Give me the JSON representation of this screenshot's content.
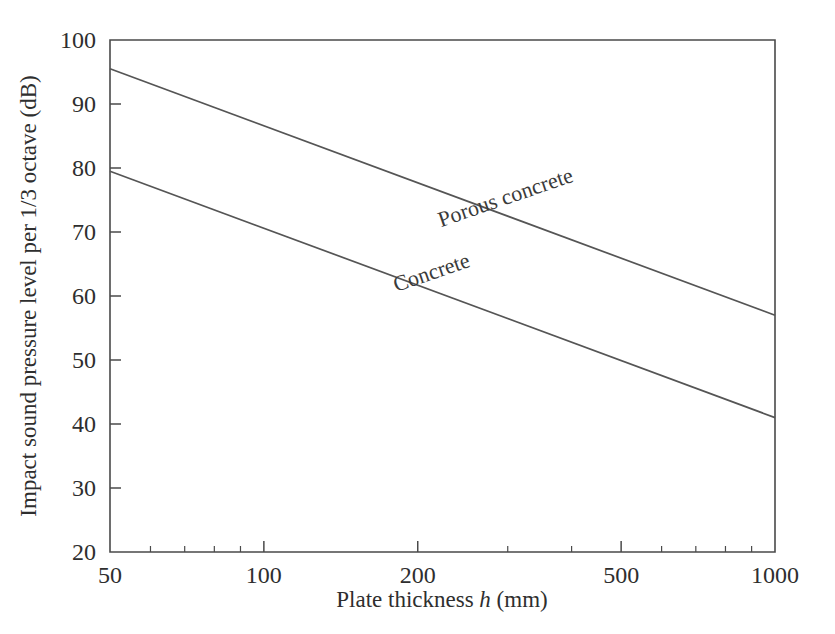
{
  "chart_data": {
    "type": "line",
    "title": "",
    "xlabel": "Plate thickness h (mm)",
    "xlabel_parts": {
      "prefix": "Plate thickness ",
      "italic": "h",
      "suffix": " (mm)"
    },
    "ylabel": "Impact sound pressure level per 1/3 octave (dB)",
    "xscale": "log",
    "yscale": "linear",
    "xlim": [
      50,
      1000
    ],
    "ylim": [
      20,
      100
    ],
    "xticks": [
      50,
      100,
      200,
      500,
      1000
    ],
    "xtick_labels": [
      "50",
      "100",
      "200",
      "500",
      "1000"
    ],
    "xticks_minor": [
      60,
      70,
      80,
      90,
      300,
      400,
      600,
      700,
      800,
      900
    ],
    "yticks": [
      20,
      30,
      40,
      50,
      60,
      70,
      80,
      90,
      100
    ],
    "ytick_labels": [
      "20",
      "30",
      "40",
      "50",
      "60",
      "70",
      "80",
      "90",
      "100"
    ],
    "grid": false,
    "legend": "inline-labels",
    "series": [
      {
        "name": "Porous concrete",
        "label": "Porous concrete",
        "label_rotation_deg": -19,
        "x": [
          50,
          1000
        ],
        "y": [
          95.5,
          57.0
        ],
        "points": [
          {
            "x": 50,
            "y": 95.5
          },
          {
            "x": 100,
            "y": 84.9
          },
          {
            "x": 200,
            "y": 74.3
          },
          {
            "x": 500,
            "y": 60.4
          },
          {
            "x": 1000,
            "y": 57.0
          }
        ]
      },
      {
        "name": "Concrete",
        "label": "Concrete",
        "label_rotation_deg": -19,
        "x": [
          50,
          1000
        ],
        "y": [
          79.5,
          41.0
        ],
        "points": [
          {
            "x": 50,
            "y": 79.5
          },
          {
            "x": 100,
            "y": 68.9
          },
          {
            "x": 200,
            "y": 58.3
          },
          {
            "x": 500,
            "y": 44.4
          },
          {
            "x": 1000,
            "y": 41.0
          }
        ]
      }
    ],
    "colors": {
      "line": "#555555",
      "axis": "#4a4a4a",
      "text": "#2e2e2e",
      "background": "#ffffff"
    }
  },
  "axes": {
    "x_tick_0": "50",
    "x_tick_1": "100",
    "x_tick_2": "200",
    "x_tick_3": "500",
    "x_tick_4": "1000",
    "y_tick_0": "20",
    "y_tick_1": "30",
    "y_tick_2": "40",
    "y_tick_3": "50",
    "y_tick_4": "60",
    "y_tick_5": "70",
    "y_tick_6": "80",
    "y_tick_7": "90",
    "y_tick_8": "100",
    "x_title_prefix": "Plate thickness ",
    "x_title_italic": "h",
    "x_title_suffix": " (mm)",
    "y_title": "Impact sound pressure level per 1/3 octave (dB)"
  },
  "labels": {
    "porous_concrete": "Porous concrete",
    "concrete": "Concrete"
  }
}
